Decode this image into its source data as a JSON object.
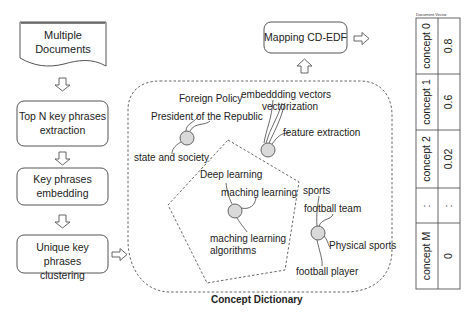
{
  "pipeline": {
    "steps": [
      {
        "id": "multiple-documents",
        "lines": [
          "Multiple",
          "Documents"
        ]
      },
      {
        "id": "top-n-extraction",
        "lines": [
          "Top N key phrases",
          "extraction"
        ]
      },
      {
        "id": "key-phrases-embedding",
        "lines": [
          "Key phrases",
          "embedding"
        ]
      },
      {
        "id": "unique-clustering",
        "lines": [
          "Unique key phrases",
          "clustering"
        ]
      }
    ]
  },
  "mapping": {
    "label": "Mapping CD-EDF"
  },
  "concept_dictionary": {
    "title": "Concept Dictionary",
    "clusters": [
      {
        "name": "politics",
        "phrases": [
          "Foreign Policy",
          "President of the Republic",
          "state and society"
        ]
      },
      {
        "name": "vectors",
        "phrases": [
          "embeddding vectors",
          "vectorization",
          "feature extraction"
        ]
      },
      {
        "name": "ml",
        "phrases": [
          "Deep learning",
          "maching learning",
          "maching learning",
          "algorithms"
        ]
      },
      {
        "name": "sports",
        "phrases": [
          "sports",
          "football team",
          "Physical sports",
          "football player"
        ]
      }
    ]
  },
  "document_vector": {
    "title": "Document Vector",
    "rows": [
      {
        "concept": "concept 0",
        "value": "0.8"
      },
      {
        "concept": "concept 1",
        "value": "0.6"
      },
      {
        "concept": "concept 2",
        "value": "0.02"
      },
      {
        "concept": ":",
        "value": ":"
      },
      {
        "concept": "concept M",
        "value": "0"
      }
    ]
  },
  "colors": {
    "stroke": "#555555",
    "node_fill": "#d9d9d9",
    "text": "#222222"
  }
}
